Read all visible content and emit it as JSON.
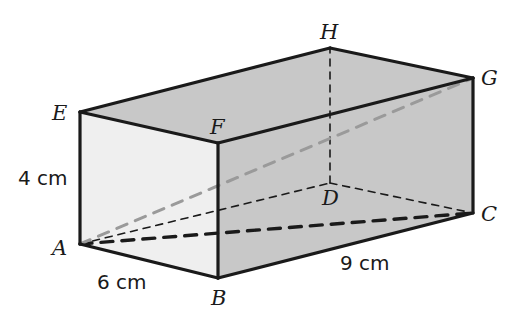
{
  "figure": {
    "shape": "rectangular prism",
    "colors": {
      "front_face_fill": "#efefef",
      "right_face_fill": "#c8c8c8",
      "top_face_fill": "#c8c8c8",
      "edge_stroke": "#1a1a1a",
      "hidden_edge_stroke": "#1a1a1a",
      "diagonal_gray_stroke": "#9a9a9a",
      "label_color": "#1a1a1a",
      "background": "#ffffff"
    },
    "vertices": [
      {
        "name": "A",
        "label": "A",
        "x": 80,
        "y": 244,
        "label_x": 52,
        "label_y": 238,
        "hidden": false
      },
      {
        "name": "B",
        "label": "B",
        "x": 218,
        "y": 278,
        "label_x": 211,
        "label_y": 288,
        "hidden": false
      },
      {
        "name": "C",
        "label": "C",
        "x": 473,
        "y": 213,
        "label_x": 481,
        "label_y": 204,
        "hidden": false
      },
      {
        "name": "D",
        "label": "D",
        "x": 330,
        "y": 183,
        "label_x": 322,
        "label_y": 188,
        "hidden": true
      },
      {
        "name": "E",
        "label": "E",
        "x": 80,
        "y": 112,
        "label_x": 52,
        "label_y": 103,
        "hidden": false
      },
      {
        "name": "F",
        "label": "F",
        "x": 218,
        "y": 143,
        "label_x": 210,
        "label_y": 117,
        "hidden": false
      },
      {
        "name": "G",
        "label": "G",
        "x": 473,
        "y": 78,
        "label_x": 481,
        "label_y": 68,
        "hidden": false
      },
      {
        "name": "H",
        "label": "H",
        "x": 330,
        "y": 48,
        "label_x": 320,
        "label_y": 22,
        "hidden": false
      }
    ],
    "dimension_labels": [
      {
        "name": "height-label",
        "text": "4 cm",
        "x": 18,
        "y": 168
      },
      {
        "name": "width-label",
        "text": "6 cm",
        "x": 97,
        "y": 272
      },
      {
        "name": "length-label",
        "text": "9 cm",
        "x": 340,
        "y": 253
      }
    ],
    "solid_edges": [
      {
        "name": "edge-AB",
        "from": "A",
        "to": "B"
      },
      {
        "name": "edge-BC",
        "from": "B",
        "to": "C"
      },
      {
        "name": "edge-AE",
        "from": "A",
        "to": "E"
      },
      {
        "name": "edge-BF",
        "from": "B",
        "to": "F"
      },
      {
        "name": "edge-CG",
        "from": "C",
        "to": "G"
      },
      {
        "name": "edge-EF",
        "from": "E",
        "to": "F"
      },
      {
        "name": "edge-FG",
        "from": "F",
        "to": "G"
      },
      {
        "name": "edge-EH",
        "from": "E",
        "to": "H"
      },
      {
        "name": "edge-HG",
        "from": "H",
        "to": "G"
      }
    ],
    "hidden_edges": [
      {
        "name": "edge-AD",
        "from": "A",
        "to": "D",
        "weight": "thin"
      },
      {
        "name": "edge-DC",
        "from": "D",
        "to": "C",
        "weight": "thin"
      },
      {
        "name": "edge-DH",
        "from": "D",
        "to": "H",
        "weight": "thin"
      }
    ],
    "diagonals": [
      {
        "name": "diagonal-AC",
        "from": "A",
        "to": "C",
        "style": "dashed-bold",
        "color": "#1a1a1a"
      },
      {
        "name": "diagonal-AG",
        "from": "A",
        "to": "G",
        "style": "dashed-gray",
        "color": "#9a9a9a"
      }
    ]
  }
}
